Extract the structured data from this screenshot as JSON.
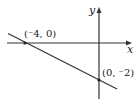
{
  "diagram": {
    "type": "coordinate-plane-line",
    "axes": {
      "x_label": "x",
      "y_label": "y"
    },
    "line": {
      "description": "straight line with negative slope through two labeled points",
      "color": "#333333"
    },
    "points": [
      {
        "id": "x-intercept",
        "label": "(⁻4, 0)",
        "x": -4,
        "y": 0
      },
      {
        "id": "y-intercept",
        "label": "(0, ⁻2)",
        "x": 0,
        "y": -2
      }
    ],
    "colors": {
      "axis": "#333333",
      "line": "#333333",
      "text": "#222222",
      "background": "#ffffff"
    }
  }
}
